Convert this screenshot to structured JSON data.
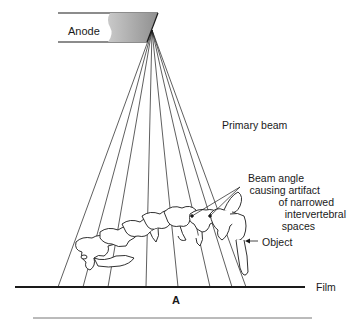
{
  "diagram": {
    "labels": {
      "anode": "Anode",
      "primary_beam": "Primary beam",
      "beam_angle_lines": [
        "Beam angle",
        "causing artifact",
        "of narrowed",
        "intervertebral",
        "spaces"
      ],
      "object": "Object",
      "film": "Film",
      "figure_letter": "A"
    },
    "colors": {
      "line": "#1a1a1a",
      "anode_fill": "#a8a8a8",
      "background": "#ffffff"
    },
    "beam": {
      "focal_point": [
        152,
        30
      ],
      "film_hits_x": [
        58,
        83,
        108,
        146,
        178,
        210,
        232,
        246
      ]
    }
  }
}
